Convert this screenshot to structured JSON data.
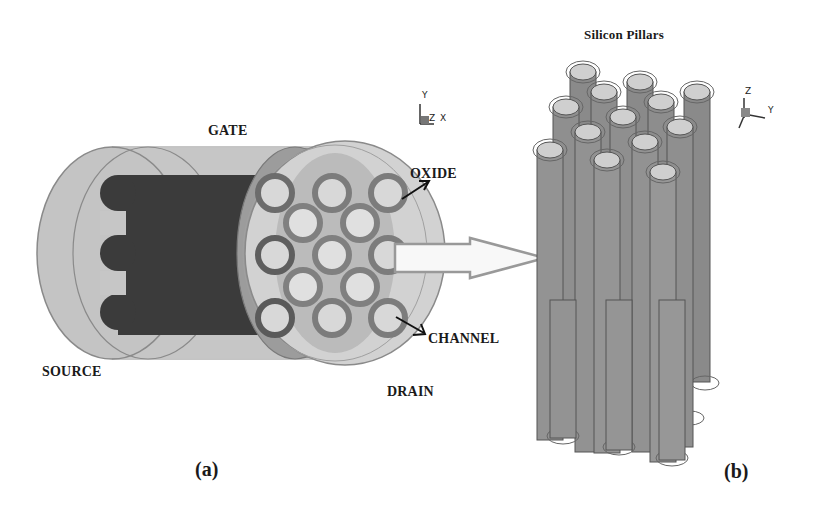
{
  "figure": {
    "panel_a": {
      "label": "(a)",
      "parts": {
        "gate": "GATE",
        "source": "SOURCE",
        "drain": "DRAIN",
        "oxide": "OXIDE",
        "channel": "CHANNEL"
      },
      "axis": {
        "y": "Y",
        "z": "Z",
        "x": "X"
      },
      "pillar_grid_rows": [
        3,
        2,
        3,
        2,
        3
      ],
      "pillar_count": 13
    },
    "panel_b": {
      "label": "(b)",
      "title": "Silicon Pillars",
      "axis": {
        "z": "Z",
        "y": "Y"
      },
      "pillar_count": 13
    },
    "colors": {
      "background": "#ffffff",
      "outer_cylinder": "#c4c4c4",
      "dark_core": "#3a3a3a",
      "oxide_ring": "#7a7a7a",
      "channel_fill": "#d6d6d6",
      "pillar_body": "#8c8c8c",
      "pillar_top": "#cfcfcf",
      "text": "#1a1a1a"
    }
  }
}
